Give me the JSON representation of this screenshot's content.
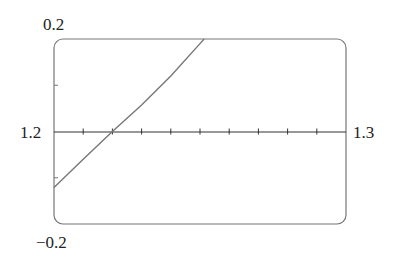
{
  "chart_data": {
    "type": "line",
    "title": "",
    "xlabel": "",
    "ylabel": "",
    "xlim": [
      1.2,
      1.3
    ],
    "ylim": [
      -0.2,
      0.2
    ],
    "grid": false,
    "legend": null,
    "x_tick_count": 10,
    "y_ticks": [
      -0.1,
      0.1
    ],
    "labels": {
      "y_max": "0.2",
      "y_min": "−0.2",
      "x_min": "1.2",
      "x_max": "1.3"
    },
    "series": [
      {
        "name": "f(x)",
        "x": [
          1.2,
          1.21,
          1.22,
          1.23,
          1.24,
          1.25,
          1.2514
        ],
        "y": [
          -0.121,
          -0.06,
          0.0,
          0.057,
          0.12,
          0.19,
          0.2
        ]
      }
    ],
    "colors": {
      "axis": "#333333",
      "frame": "#777777",
      "curve": "#777777"
    }
  }
}
